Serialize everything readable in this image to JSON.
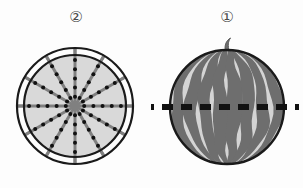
{
  "figure": {
    "background_color": "#fdfdfd"
  },
  "panels": [
    {
      "id": "cross-section",
      "callout_label": "②",
      "callout_number": "2",
      "description": "Circular cross-section of a watermelon showing radial seed rows",
      "shape": "circle",
      "rind_ring": true,
      "spoke_count": 12,
      "spoke_angle_step_deg": 30,
      "seeds_per_spoke": 5,
      "colors": {
        "flesh": "#d9d9d9",
        "outline": "#1a1a1a",
        "spoke": "#808080",
        "seed": "#111111"
      },
      "geometry": {
        "center_x": 75,
        "center_y": 106,
        "inner_radius": 51,
        "outer_radius": 58,
        "spoke_overhang": 7
      }
    },
    {
      "id": "whole-melon",
      "callout_label": "①",
      "callout_number": "1",
      "description": "Whole striped watermelon with a horizontal dashed cutting line through its middle",
      "shape": "circle",
      "stem": true,
      "stripe_count": 8,
      "cut_line": {
        "style": "dashed",
        "orientation": "horizontal",
        "color": "#111111",
        "dash_length": 11,
        "dash_gap": 8,
        "extends_beyond_fruit": true
      },
      "colors": {
        "light_flesh": "#d4d4d4",
        "dark_stripe": "#6e6e6e",
        "outline": "#1a1a1a",
        "stem": "#6e6e6e"
      },
      "geometry": {
        "center_x": 76,
        "center_y": 107,
        "radius": 58
      }
    }
  ]
}
